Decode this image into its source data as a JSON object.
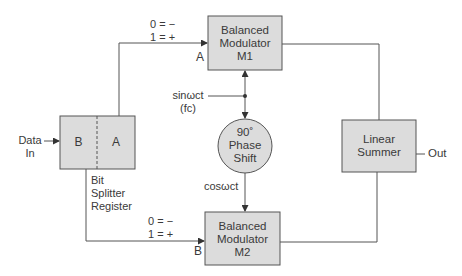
{
  "diagram": {
    "colors": {
      "box_fill": "#dcdcdc",
      "stroke": "#555555",
      "text": "#3a3a3a"
    },
    "input": {
      "line1": "Data",
      "line2": "In"
    },
    "bit_splitter": {
      "left_cell": "B",
      "right_cell": "A",
      "caption": [
        "Bit",
        "Splitter",
        "Register"
      ]
    },
    "channel_a": {
      "map1": "0 = −",
      "map2": "1 = +",
      "label": "A"
    },
    "channel_b": {
      "map1": "0 = −",
      "map2": "1 = +",
      "label": "B"
    },
    "modulator_m1": {
      "line1": "Balanced",
      "line2": "Modulator",
      "line3": "M1"
    },
    "modulator_m2": {
      "line1": "Balanced",
      "line2": "Modulator",
      "line3": "M2"
    },
    "carrier": {
      "line1": "sinωct",
      "line2": "(fc)"
    },
    "phase_shift": {
      "line1": "90˚",
      "line2": "Phase",
      "line3": "Shift"
    },
    "cos_label": "cosωct",
    "summer": {
      "line1": "Linear",
      "line2": "Summer"
    },
    "output": "Out"
  }
}
